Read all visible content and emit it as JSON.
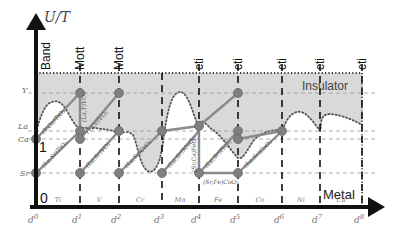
{
  "figure": {
    "y_axis_label": "U/T",
    "regime_labels": {
      "top": [
        "Band",
        "Mott",
        "Mott",
        "cti",
        "cti",
        "cti",
        "cti",
        "cti",
        "cti"
      ],
      "insulator": "Insulator",
      "metal": "Metal"
    },
    "y_levels": {
      "Y": "Y",
      "La": "La",
      "Ca": "Ca",
      "Sr": "Sr",
      "one": "1",
      "zero": "0"
    },
    "x_ticks": [
      "d",
      "d",
      "d",
      "d",
      "d",
      "d",
      "d",
      "d",
      "d"
    ],
    "x_tick_sups": [
      "0",
      "1",
      "2",
      "3",
      "4",
      "5",
      "6",
      "7",
      "8"
    ],
    "elements": [
      "Ti",
      "V",
      "Cr",
      "Mn",
      "Fe",
      "Co",
      "Ni",
      "Cu"
    ],
    "compound_labels": {
      "ti_ca": "(Y,Ca)TiO₃",
      "ti_sr": "(La,Sr)TiO₃",
      "v_la": "(La,Y)VO₃",
      "v_ca": "(Y,Ca)VO₃",
      "v_sr": "(La,Sr)VO₃",
      "cr_sr": "(La,Sr)CrO₃",
      "mn_sr": "(La,Sr)MnO₃",
      "fe_sr": "(La,Sr)FeO₃",
      "fe_ca": "(Sr,Ca)FeO₃",
      "co_srfe": "(Sr,Fe)CoO₃",
      "co_sr": "(La,Sr)CoO₃"
    },
    "colors": {
      "insulator_fill": "#d9d9d9",
      "line": "#8a8a8a",
      "node": "#808080",
      "axis": "#111111",
      "level_dash": "#9a9a9a"
    }
  }
}
